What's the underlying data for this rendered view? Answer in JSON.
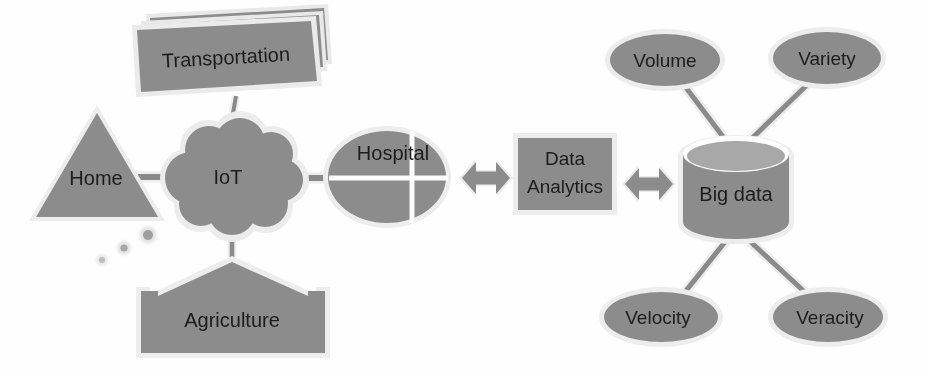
{
  "diagram": {
    "colors": {
      "node_fill": "#8c8c8c",
      "node_outline": "#e6e6e6",
      "connector": "#8a8a8a",
      "cylinder_top": "#a8a8a8",
      "background": "#fefefe",
      "label_text": "#1c1c1c"
    },
    "nodes": [
      {
        "id": "transportation",
        "label": "Transportation",
        "shape": "stacked-documents",
        "group": "iot-sources",
        "x": 222,
        "y": 60
      },
      {
        "id": "home",
        "label": "Home",
        "shape": "triangle",
        "group": "iot-sources",
        "x": 97,
        "y": 178
      },
      {
        "id": "iot",
        "label": "IoT",
        "shape": "cloud",
        "group": "network",
        "x": 232,
        "y": 177
      },
      {
        "id": "agriculture",
        "label": "Agriculture",
        "shape": "up-arrow-block",
        "group": "iot-sources",
        "x": 232,
        "y": 312
      },
      {
        "id": "hospital",
        "label": "Hospital",
        "shape": "quartered-ellipse",
        "group": "iot-sources",
        "x": 387,
        "y": 177
      },
      {
        "id": "data-analytics",
        "label": "Data Analytics",
        "label_line1": "Data",
        "label_line2": "Analytics",
        "shape": "rectangle",
        "group": "processing",
        "x": 565,
        "y": 174
      },
      {
        "id": "big-data",
        "label": "Big data",
        "shape": "cylinder",
        "group": "storage",
        "x": 735,
        "y": 190
      },
      {
        "id": "volume",
        "label": "Volume",
        "shape": "ellipse",
        "group": "big-data-v",
        "x": 665,
        "y": 60
      },
      {
        "id": "variety",
        "label": "Variety",
        "shape": "ellipse",
        "group": "big-data-v",
        "x": 826,
        "y": 58
      },
      {
        "id": "velocity",
        "label": "Velocity",
        "shape": "ellipse",
        "group": "big-data-v",
        "x": 661,
        "y": 317
      },
      {
        "id": "veracity",
        "label": "Veracity",
        "shape": "ellipse",
        "group": "big-data-v",
        "x": 828,
        "y": 317
      }
    ],
    "connectors": [
      {
        "id": "transportation-iot",
        "from": "transportation",
        "to": "iot",
        "style": "line"
      },
      {
        "id": "home-iot",
        "from": "home",
        "to": "iot",
        "style": "line"
      },
      {
        "id": "agriculture-iot",
        "from": "agriculture",
        "to": "iot",
        "style": "line"
      },
      {
        "id": "iot-hospital",
        "from": "iot",
        "to": "hospital",
        "style": "line"
      },
      {
        "id": "hospital-data-analytics",
        "from": "hospital",
        "to": "data-analytics",
        "style": "double-arrow"
      },
      {
        "id": "data-analytics-big-data",
        "from": "data-analytics",
        "to": "big-data",
        "style": "double-arrow"
      },
      {
        "id": "volume-big-data",
        "from": "volume",
        "to": "big-data",
        "style": "line"
      },
      {
        "id": "variety-big-data",
        "from": "variety",
        "to": "big-data",
        "style": "line"
      },
      {
        "id": "big-data-velocity",
        "from": "big-data",
        "to": "velocity",
        "style": "line"
      },
      {
        "id": "big-data-veracity",
        "from": "big-data",
        "to": "veracity",
        "style": "line"
      }
    ],
    "decorations": [
      {
        "id": "signal-dot-large",
        "shape": "dot",
        "x": 148,
        "y": 235,
        "r": 6
      },
      {
        "id": "signal-dot-medium",
        "shape": "dot",
        "x": 124,
        "y": 248,
        "r": 4.5
      },
      {
        "id": "signal-dot-small",
        "shape": "dot",
        "x": 103,
        "y": 259,
        "r": 3.5
      }
    ]
  }
}
